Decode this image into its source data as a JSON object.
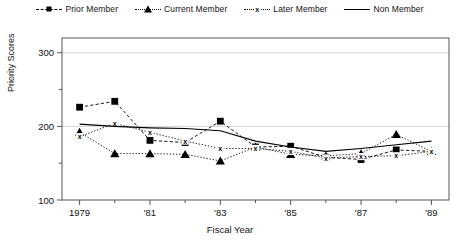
{
  "chart_data": {
    "type": "line",
    "title": "",
    "xlabel": "Fiscal Year",
    "ylabel": "Priority Scores",
    "x": [
      1979,
      1980,
      1981,
      1982,
      1983,
      1984,
      1985,
      1986,
      1987,
      1988,
      1989
    ],
    "xtick_labels": [
      "1979",
      "'81",
      "'83",
      "'85",
      "'87",
      "'89"
    ],
    "xtick_values": [
      1979,
      1981,
      1983,
      1985,
      1987,
      1989
    ],
    "xminor_values": [
      1980,
      1982,
      1984,
      1986,
      1988
    ],
    "xlim": [
      1978.5,
      1989.5
    ],
    "ytick_labels": [
      "100",
      "200",
      "300"
    ],
    "ytick_values": [
      100,
      200,
      300
    ],
    "yminor_values": [
      150,
      250
    ],
    "ylim": [
      100,
      320
    ],
    "grid": "horizontal-major",
    "legend_position": "top-center",
    "series": [
      {
        "name": "Prior Member",
        "marker": "square",
        "line_style": "dashed",
        "values": [
          226,
          234,
          181,
          178,
          207,
          172,
          173,
          158,
          155,
          168,
          166
        ]
      },
      {
        "name": "Current Member",
        "marker": "triangle",
        "line_style": "dotted",
        "values": [
          192,
          163,
          163,
          162,
          153,
          172,
          162,
          160,
          163,
          189,
          166
        ]
      },
      {
        "name": "Later Member",
        "marker": "x",
        "line_style": "dotted",
        "values": [
          186,
          204,
          192,
          180,
          170,
          170,
          166,
          157,
          159,
          160,
          166
        ]
      },
      {
        "name": "Non Member",
        "marker": "none",
        "line_style": "solid",
        "values": [
          203,
          200,
          198,
          197,
          194,
          180,
          172,
          166,
          170,
          175,
          180
        ]
      }
    ]
  },
  "legend": {
    "items": [
      {
        "label": "Prior Member",
        "marker": "square-marker",
        "style": "dashed"
      },
      {
        "label": "Current Member",
        "marker": "triangle-marker",
        "style": "dotted"
      },
      {
        "label": "Later Member",
        "marker": "x-marker",
        "style": "dotted"
      },
      {
        "label": "Non Member",
        "marker": "line-marker",
        "style": "solid"
      }
    ]
  }
}
